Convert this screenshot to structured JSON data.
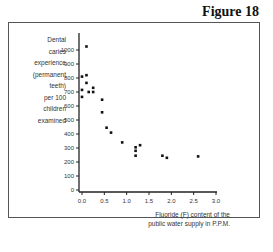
{
  "figure": {
    "title": "Figure 18"
  },
  "chart_data": {
    "type": "scatter",
    "title": "",
    "xlabel": "Fluoride (F) content of the public water supply in P.P.M.",
    "ylabel": "Dental caries experience (permanent teeth) per 100 children examined",
    "xlim": [
      0,
      3.0
    ],
    "ylim": [
      0,
      1100
    ],
    "xticks": [
      "0.0",
      "0.5",
      "1.0",
      "1.5",
      "2.0",
      "2.5",
      "3.0"
    ],
    "yticks": [
      "0",
      "100",
      "200",
      "300",
      "400",
      "500",
      "600",
      "700",
      "800",
      "900",
      "1000"
    ],
    "grid": false,
    "legend": null,
    "points": [
      {
        "x": 0.1,
        "y": 1025
      },
      {
        "x": 0.0,
        "y": 810
      },
      {
        "x": 0.1,
        "y": 820
      },
      {
        "x": 0.1,
        "y": 765
      },
      {
        "x": 0.0,
        "y": 715
      },
      {
        "x": 0.15,
        "y": 700
      },
      {
        "x": 0.25,
        "y": 730
      },
      {
        "x": 0.25,
        "y": 700
      },
      {
        "x": 0.0,
        "y": 665
      },
      {
        "x": 0.45,
        "y": 645
      },
      {
        "x": 0.45,
        "y": 555
      },
      {
        "x": 0.55,
        "y": 445
      },
      {
        "x": 0.65,
        "y": 410
      },
      {
        "x": 0.9,
        "y": 340
      },
      {
        "x": 1.2,
        "y": 305
      },
      {
        "x": 1.2,
        "y": 280
      },
      {
        "x": 1.2,
        "y": 245
      },
      {
        "x": 1.3,
        "y": 320
      },
      {
        "x": 1.8,
        "y": 245
      },
      {
        "x": 1.9,
        "y": 230
      },
      {
        "x": 2.6,
        "y": 240
      }
    ]
  },
  "labels": {
    "ylabel_lines": [
      "Dental",
      "caries",
      "experience",
      "(permanent",
      "teeth)",
      "per 100",
      "children",
      "examined"
    ],
    "xlabel_lines": [
      "Fluoride (F) content of the",
      "public water supply in P.P.M."
    ]
  }
}
